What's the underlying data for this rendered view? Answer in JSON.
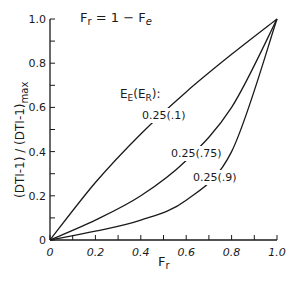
{
  "chart_data": {
    "type": "line",
    "title": "",
    "annotation": "F_r = 1 - F_e",
    "xlabel": "F_r",
    "ylabel": "(DTI-1)/(DTI-1)_max",
    "xlim": [
      0,
      1.0
    ],
    "ylim": [
      0,
      1.0
    ],
    "xticks": [
      "0",
      "0.2",
      "0.4",
      "0.6",
      "0.8",
      "1.0"
    ],
    "yticks": [
      "0",
      "0.2",
      "0.4",
      "0.6",
      "0.8",
      "1.0"
    ],
    "grid": false,
    "legend_title": "E_E(E_R):",
    "x": [
      0,
      0.2,
      0.4,
      0.6,
      0.8,
      1.0
    ],
    "series": [
      {
        "name": "0.25(.1)",
        "values": [
          0,
          0.26,
          0.48,
          0.67,
          0.84,
          1.0
        ]
      },
      {
        "name": "0.25(.75)",
        "values": [
          0,
          0.09,
          0.2,
          0.36,
          0.6,
          1.0
        ]
      },
      {
        "name": "0.25(.9)",
        "values": [
          0,
          0.04,
          0.09,
          0.18,
          0.4,
          1.0
        ]
      }
    ]
  },
  "labels": {
    "annotation_main": "F",
    "annotation_sub1": "r",
    "annotation_rest": " = 1 − F",
    "annotation_sub2": "e",
    "xlabel_main": "F",
    "xlabel_sub": "r",
    "ylabel": "(DTI-1) / (DTI-1)",
    "ylabel_sub": "max",
    "legend_title_E": "E",
    "legend_title_Esub": "E",
    "legend_title_paren": "(E",
    "legend_title_Rsub": "R",
    "legend_title_end": "):",
    "series_labels": [
      "0.25(.1)",
      "0.25(.75)",
      "0.25(.9)"
    ]
  }
}
